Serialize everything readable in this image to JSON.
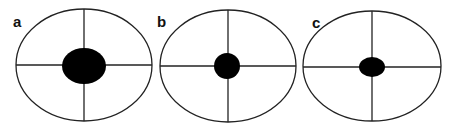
{
  "panels": [
    {
      "label": "a",
      "outer": {
        "cx": 84,
        "cy": 65,
        "rx": 68,
        "ry": 56
      },
      "spot": {
        "cx": 84,
        "cy": 66,
        "rx": 22,
        "ry": 18
      },
      "label_pos": {
        "x": 13,
        "y": 27
      }
    },
    {
      "label": "b",
      "outer": {
        "cx": 228,
        "cy": 66,
        "rx": 68,
        "ry": 56
      },
      "spot": {
        "cx": 227,
        "cy": 66,
        "rx": 13,
        "ry": 13
      },
      "label_pos": {
        "x": 157,
        "y": 27
      }
    },
    {
      "label": "c",
      "outer": {
        "cx": 372,
        "cy": 66,
        "rx": 69,
        "ry": 55
      },
      "spot": {
        "cx": 372,
        "cy": 67,
        "rx": 13,
        "ry": 10
      },
      "label_pos": {
        "x": 312,
        "y": 28
      }
    }
  ],
  "colors": {
    "stroke": "#222222",
    "spot": "#000000",
    "background": "#ffffff"
  }
}
